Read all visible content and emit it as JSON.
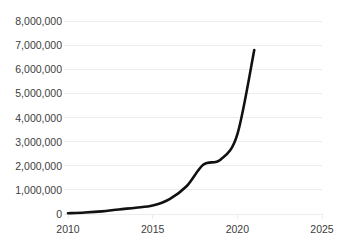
{
  "chart_data": {
    "type": "line",
    "title": "",
    "xlabel": "",
    "ylabel": "",
    "xlim": [
      2010,
      2025
    ],
    "ylim": [
      0,
      8000000
    ],
    "grid": true,
    "legend": null,
    "line_color": "#111111",
    "grid_color": "#ececec",
    "background_color": "#ffffff",
    "x": [
      2010,
      2011,
      2012,
      2013,
      2014,
      2015,
      2016,
      2017,
      2018,
      2019,
      2020,
      2021
    ],
    "values": [
      30000,
      60000,
      110000,
      190000,
      260000,
      350000,
      620000,
      1150000,
      2050000,
      2250000,
      3300000,
      6800000
    ],
    "series": [
      {
        "name": "",
        "values": [
          30000,
          60000,
          110000,
          190000,
          260000,
          350000,
          620000,
          1150000,
          2050000,
          2250000,
          3300000,
          6800000
        ]
      }
    ],
    "ytick_labels": [
      "8,000,000",
      "7,000,000",
      "6,000,000",
      "5,000,000",
      "4,000,000",
      "3,000,000",
      "2,000,000",
      "1,000,000",
      "0"
    ],
    "ytick_values": [
      8000000,
      7000000,
      6000000,
      5000000,
      4000000,
      3000000,
      2000000,
      1000000,
      0
    ],
    "xtick_labels": [
      "2010",
      "2015",
      "2020",
      "2025"
    ],
    "xtick_values": [
      2010,
      2015,
      2020,
      2025
    ]
  },
  "header": {
    "cutoff_title": ""
  }
}
